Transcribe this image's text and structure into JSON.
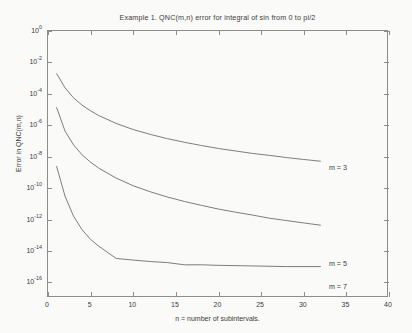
{
  "chart_data": {
    "type": "line",
    "title": "Example 1.   QNC(m,n) error for integral of sin from 0 to pi/2",
    "xlabel": "n = number of subintervals.",
    "ylabel": "Error in QNC(m,n)",
    "yscale": "log",
    "xlim": [
      0,
      40
    ],
    "ylim": [
      1e-17,
      1
    ],
    "xticks": [
      0,
      5,
      10,
      15,
      20,
      25,
      30,
      35,
      40
    ],
    "xtick_labels": [
      "0",
      "5",
      "10",
      "15",
      "20",
      "25",
      "30",
      "35",
      "40"
    ],
    "yticks": [
      1,
      0.01,
      0.0001,
      1e-06,
      1e-08,
      1e-10,
      1e-12,
      1e-14,
      1e-16
    ],
    "ytick_labels": [
      "10",
      "10",
      "10",
      "10",
      "10",
      "10",
      "10",
      "10",
      "10"
    ],
    "ytick_exponents": [
      "0",
      "-2",
      "-4",
      "-6",
      "-8",
      "-10",
      "-12",
      "-14",
      "-16"
    ],
    "grid": false,
    "legend_position": "right-inline",
    "line_color": "#6e6e6e",
    "axis_color": "#8d8d8d",
    "text_color": "#3a3a3a",
    "background_color": "#fafaf9",
    "series": [
      {
        "name": "m = 3",
        "label": "m = 3",
        "label_x": 32.6,
        "label_y": 2e-09,
        "x": [
          1,
          2,
          3,
          4,
          5,
          6,
          8,
          10,
          12,
          14,
          16,
          18,
          20,
          22,
          24,
          26,
          28,
          30,
          32
        ],
        "y": [
          0.002,
          0.00024,
          5.5e-05,
          1.9e-05,
          8.2e-06,
          4e-06,
          1.3e-06,
          5.3e-07,
          2.6e-07,
          1.4e-07,
          8.2e-08,
          5.1e-08,
          3.3e-08,
          2.3e-08,
          1.6e-08,
          1.2e-08,
          8.7e-09,
          6.6e-09,
          5.1e-09
        ]
      },
      {
        "name": "m = 5",
        "label": "m = 5",
        "label_x": 32.6,
        "label_y": 1.4e-15,
        "x": [
          1,
          2,
          3,
          4,
          5,
          6,
          8,
          10,
          12,
          14,
          16,
          18,
          20,
          22,
          24,
          26,
          28,
          30,
          32
        ],
        "y": [
          1.4e-05,
          4.2e-07,
          5.6e-08,
          1.3e-08,
          4.4e-09,
          1.8e-09,
          4.3e-10,
          1.4e-10,
          5.8e-11,
          2.7e-11,
          1.4e-11,
          7.9e-12,
          4.6e-12,
          2.9e-12,
          1.9e-12,
          1.2e-12,
          8.5e-13,
          6e-13,
          4.3e-13
        ]
      },
      {
        "name": "m = 7",
        "label": "m = 7",
        "label_x": 32.6,
        "label_y": 5e-17,
        "x": [
          1,
          2,
          3,
          4,
          5,
          6,
          8,
          10,
          12,
          14,
          16,
          18,
          20,
          24,
          28,
          32
        ],
        "y": [
          2.5e-09,
          3e-11,
          1.6e-12,
          2.2e-13,
          5.3e-14,
          1.9e-14,
          3.3e-15,
          2.6e-15,
          2.1e-15,
          1.8e-15,
          1.3e-15,
          1.3e-15,
          1.2e-15,
          1.1e-15,
          1e-15,
          1e-15
        ]
      }
    ]
  }
}
